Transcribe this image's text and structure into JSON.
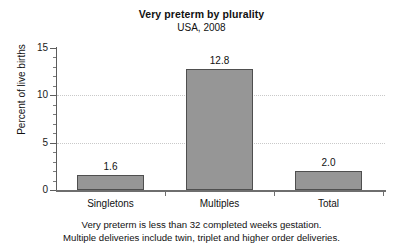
{
  "chart_data": {
    "type": "bar",
    "title": "Very preterm by plurality",
    "subtitle": "USA, 2008",
    "categories": [
      "Singletons",
      "Multiples",
      "Total"
    ],
    "values": [
      1.6,
      12.8,
      2.0
    ],
    "value_labels": [
      "1.6",
      "12.8",
      "2.0"
    ],
    "xlabel": "",
    "ylabel": "Percent of live births",
    "ylim": [
      0,
      15
    ],
    "ytick_labels": [
      "0",
      "5",
      "10",
      "15"
    ],
    "ytick_values": [
      0,
      5,
      10,
      15
    ],
    "yminor_step": 1,
    "gridlines": {
      "visible_at": [
        5,
        10
      ],
      "style": "dotted",
      "color": "#c9c9c9"
    },
    "legend": null,
    "series": [
      {
        "name": "Very preterm",
        "values": [
          1.6,
          12.8,
          2.0
        ],
        "bar_fill": "#969696",
        "bar_border": "#4f4f4f"
      }
    ],
    "footnote_lines": [
      "Very preterm is less than 32 completed weeks gestation.",
      "Multiple deliveries include twin, triplet and higher order deliveries."
    ]
  }
}
